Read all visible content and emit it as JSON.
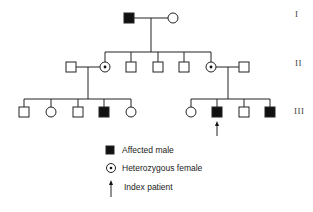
{
  "pedigree": {
    "generations": [
      {
        "label": "I",
        "x": 295,
        "y": 9
      },
      {
        "label": "II",
        "x": 295,
        "y": 58
      },
      {
        "label": "III",
        "x": 295,
        "y": 106
      }
    ],
    "individuals": {
      "gen1": [
        {
          "sex": "male",
          "status": "affected",
          "cx": 129,
          "cy": 18
        },
        {
          "sex": "female",
          "status": "normal",
          "cx": 173,
          "cy": 18
        }
      ],
      "gen2": [
        {
          "sex": "male",
          "status": "normal",
          "cx": 71,
          "cy": 67,
          "note": "spouse"
        },
        {
          "sex": "female",
          "status": "heterozygous",
          "cx": 105,
          "cy": 67
        },
        {
          "sex": "male",
          "status": "normal",
          "cx": 131,
          "cy": 67
        },
        {
          "sex": "male",
          "status": "normal",
          "cx": 158,
          "cy": 67
        },
        {
          "sex": "male",
          "status": "normal",
          "cx": 184,
          "cy": 67
        },
        {
          "sex": "female",
          "status": "heterozygous",
          "cx": 211,
          "cy": 67
        },
        {
          "sex": "male",
          "status": "normal",
          "cx": 244,
          "cy": 67,
          "note": "spouse"
        }
      ],
      "gen3_left": [
        {
          "sex": "male",
          "status": "normal",
          "cx": 24,
          "cy": 112
        },
        {
          "sex": "female",
          "status": "normal",
          "cx": 51,
          "cy": 112
        },
        {
          "sex": "male",
          "status": "normal",
          "cx": 78,
          "cy": 112
        },
        {
          "sex": "male",
          "status": "affected",
          "cx": 104,
          "cy": 112
        },
        {
          "sex": "female",
          "status": "normal",
          "cx": 131,
          "cy": 112
        }
      ],
      "gen3_right": [
        {
          "sex": "female",
          "status": "normal",
          "cx": 191,
          "cy": 112
        },
        {
          "sex": "male",
          "status": "affected",
          "cx": 217,
          "cy": 112,
          "index_patient": true
        },
        {
          "sex": "male",
          "status": "normal",
          "cx": 244,
          "cy": 112
        },
        {
          "sex": "male",
          "status": "affected",
          "cx": 270,
          "cy": 112
        }
      ]
    }
  },
  "legend": {
    "items": [
      {
        "symbol": "filled-square",
        "label": "Affected male"
      },
      {
        "symbol": "dotted-circle",
        "label": "Heterozygous female"
      },
      {
        "symbol": "arrow",
        "label": "Index patient"
      }
    ]
  },
  "colors": {
    "line": "#222222",
    "fill_affected": "#111111",
    "background": "#ffffff"
  }
}
